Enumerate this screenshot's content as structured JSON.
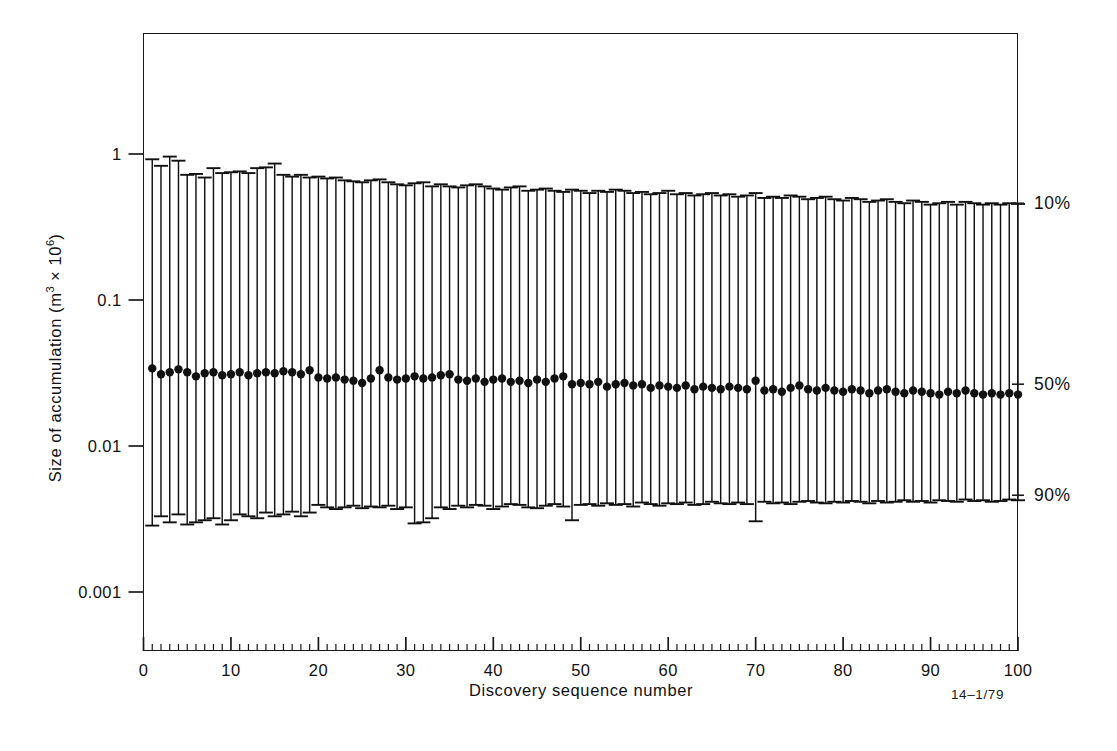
{
  "figure": {
    "reference_number": "14–1/79",
    "x_axis_title": "Discovery sequence number",
    "y_axis_title_pre": "Size of accumulation (m",
    "y_axis_title_sup1": "3",
    "y_axis_title_mid": " × 10",
    "y_axis_title_sup2": "6",
    "y_axis_title_post": ")"
  },
  "percentile_labels": [
    {
      "text": "10%",
      "y_value": 0.46
    },
    {
      "text": "50%",
      "y_value": 0.0265
    },
    {
      "text": "90%",
      "y_value": 0.0046
    }
  ],
  "chart_data": {
    "type": "line",
    "subtype": "error-bar-percentile-plot",
    "title": "",
    "xlabel": "Discovery sequence number",
    "ylabel": "Size of accumulation (m3 × 10^6)",
    "xlim": [
      0,
      100
    ],
    "ylim": [
      0.001,
      1.0
    ],
    "yscale": "log",
    "xscale": "linear",
    "grid": false,
    "legend": null,
    "x_major_ticks": [
      0,
      10,
      20,
      30,
      40,
      50,
      60,
      70,
      80,
      90,
      100
    ],
    "x_minor_tick_step": 1,
    "y_major_ticks": [
      1,
      0.1,
      0.01,
      0.001
    ],
    "y_tick_labels": [
      "1",
      "0.1",
      "0.01",
      "0.001"
    ],
    "marker": "filled-circle",
    "series": [
      {
        "name": "10th percentile (upper cap)",
        "key": "p10"
      },
      {
        "name": "50th percentile (median, filled circle)",
        "key": "p50"
      },
      {
        "name": "90th percentile (lower cap)",
        "key": "p90"
      }
    ],
    "x": [
      1,
      2,
      3,
      4,
      5,
      6,
      7,
      8,
      9,
      10,
      11,
      12,
      13,
      14,
      15,
      16,
      17,
      18,
      19,
      20,
      21,
      22,
      23,
      24,
      25,
      26,
      27,
      28,
      29,
      30,
      31,
      32,
      33,
      34,
      35,
      36,
      37,
      38,
      39,
      40,
      41,
      42,
      43,
      44,
      45,
      46,
      47,
      48,
      49,
      50,
      51,
      52,
      53,
      54,
      55,
      56,
      57,
      58,
      59,
      60,
      61,
      62,
      63,
      64,
      65,
      66,
      67,
      68,
      69,
      70,
      71,
      72,
      73,
      74,
      75,
      76,
      77,
      78,
      79,
      80,
      81,
      82,
      83,
      84,
      85,
      86,
      87,
      88,
      89,
      90,
      91,
      92,
      93,
      94,
      95,
      96,
      97,
      98,
      99,
      100
    ],
    "p10": [
      0.92,
      0.83,
      0.96,
      0.9,
      0.72,
      0.73,
      0.69,
      0.8,
      0.74,
      0.75,
      0.76,
      0.74,
      0.8,
      0.81,
      0.86,
      0.72,
      0.7,
      0.72,
      0.69,
      0.7,
      0.68,
      0.69,
      0.66,
      0.65,
      0.64,
      0.66,
      0.67,
      0.64,
      0.62,
      0.61,
      0.63,
      0.64,
      0.6,
      0.62,
      0.6,
      0.59,
      0.61,
      0.62,
      0.6,
      0.58,
      0.57,
      0.59,
      0.6,
      0.56,
      0.57,
      0.58,
      0.56,
      0.55,
      0.57,
      0.56,
      0.54,
      0.56,
      0.55,
      0.57,
      0.56,
      0.54,
      0.55,
      0.53,
      0.54,
      0.56,
      0.53,
      0.54,
      0.52,
      0.53,
      0.54,
      0.52,
      0.53,
      0.51,
      0.52,
      0.54,
      0.5,
      0.51,
      0.5,
      0.52,
      0.51,
      0.49,
      0.5,
      0.51,
      0.49,
      0.48,
      0.5,
      0.49,
      0.47,
      0.48,
      0.49,
      0.47,
      0.46,
      0.48,
      0.47,
      0.45,
      0.46,
      0.47,
      0.45,
      0.47,
      0.46,
      0.45,
      0.46,
      0.45,
      0.46,
      0.455
    ],
    "p50": [
      0.034,
      0.031,
      0.032,
      0.0335,
      0.032,
      0.03,
      0.0315,
      0.032,
      0.0305,
      0.031,
      0.032,
      0.0305,
      0.0315,
      0.032,
      0.0315,
      0.0325,
      0.032,
      0.031,
      0.033,
      0.0295,
      0.029,
      0.0295,
      0.0285,
      0.028,
      0.027,
      0.029,
      0.033,
      0.0295,
      0.0285,
      0.029,
      0.03,
      0.029,
      0.0295,
      0.0305,
      0.031,
      0.0285,
      0.028,
      0.029,
      0.0275,
      0.0285,
      0.029,
      0.0275,
      0.028,
      0.027,
      0.0285,
      0.0275,
      0.029,
      0.03,
      0.0265,
      0.027,
      0.0265,
      0.0275,
      0.0255,
      0.0265,
      0.027,
      0.026,
      0.0265,
      0.025,
      0.026,
      0.0255,
      0.025,
      0.026,
      0.0245,
      0.0255,
      0.025,
      0.0245,
      0.0255,
      0.025,
      0.0245,
      0.028,
      0.024,
      0.0245,
      0.0235,
      0.025,
      0.026,
      0.0245,
      0.024,
      0.025,
      0.024,
      0.0235,
      0.0245,
      0.024,
      0.023,
      0.024,
      0.0245,
      0.0235,
      0.023,
      0.024,
      0.0235,
      0.023,
      0.0225,
      0.0235,
      0.023,
      0.024,
      0.023,
      0.0225,
      0.023,
      0.0225,
      0.023,
      0.0225
    ],
    "p90": [
      0.00285,
      0.0033,
      0.003,
      0.0034,
      0.0029,
      0.003,
      0.0031,
      0.0032,
      0.0029,
      0.0031,
      0.0034,
      0.0033,
      0.0032,
      0.0035,
      0.0033,
      0.0034,
      0.00355,
      0.0033,
      0.0035,
      0.00395,
      0.0038,
      0.0037,
      0.0038,
      0.0039,
      0.00375,
      0.00385,
      0.0038,
      0.0039,
      0.0037,
      0.0038,
      0.00295,
      0.003,
      0.0032,
      0.0038,
      0.0037,
      0.0039,
      0.0038,
      0.00395,
      0.0039,
      0.0037,
      0.00385,
      0.004,
      0.00395,
      0.0038,
      0.00375,
      0.0039,
      0.004,
      0.00385,
      0.0031,
      0.00395,
      0.004,
      0.0039,
      0.00405,
      0.00395,
      0.004,
      0.00385,
      0.0041,
      0.004,
      0.0039,
      0.00405,
      0.004,
      0.0041,
      0.00395,
      0.004,
      0.00415,
      0.00405,
      0.004,
      0.0041,
      0.004,
      0.00305,
      0.00415,
      0.00405,
      0.0041,
      0.004,
      0.00415,
      0.0042,
      0.0041,
      0.00405,
      0.00415,
      0.0041,
      0.0042,
      0.00415,
      0.00405,
      0.0042,
      0.0041,
      0.00415,
      0.00425,
      0.00415,
      0.0042,
      0.0041,
      0.00425,
      0.0042,
      0.00415,
      0.0043,
      0.0042,
      0.00425,
      0.00415,
      0.0042,
      0.0043,
      0.00425
    ]
  }
}
